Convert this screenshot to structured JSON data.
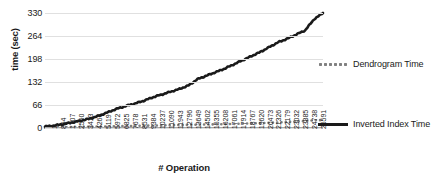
{
  "chart_data": {
    "type": "line",
    "title": "",
    "xlabel": "# Operation",
    "ylabel": "time (sec)",
    "ylim": [
      0,
      330
    ],
    "yticks": [
      0,
      66,
      132,
      198,
      264,
      330
    ],
    "grid": true,
    "legend_position": "right",
    "x_tick_labels": [
      "1",
      "854",
      "1707",
      "2560",
      "3413",
      "4266",
      "5119",
      "5972",
      "6825",
      "7678",
      "8531",
      "9384",
      "10237",
      "11090",
      "11943",
      "12796",
      "13649",
      "14502",
      "15355",
      "16208",
      "17061",
      "17914",
      "18767",
      "19620",
      "20473",
      "21326",
      "22179",
      "23032",
      "23885",
      "24738",
      "25591"
    ],
    "x_range": [
      1,
      26444
    ],
    "series": [
      {
        "name": "Dendrogram Time",
        "style": "dotted",
        "color": "#808080",
        "x": [
          1,
          854,
          1707,
          2560,
          3413,
          4266,
          5119,
          5972,
          6825,
          7678,
          8531,
          9384,
          10237,
          11090,
          11943,
          12796,
          13649,
          14502,
          15355,
          16208,
          17061,
          17914,
          18767,
          19620,
          20473,
          21326,
          22179,
          23032,
          23885,
          24738,
          25591,
          26444
        ],
        "values": [
          1,
          1.5,
          2,
          2.5,
          3,
          3.5,
          4,
          4.5,
          5,
          5.5,
          6,
          6.5,
          7,
          7.5,
          8,
          8.5,
          9,
          9.5,
          10,
          10.5,
          11,
          11.5,
          12.5,
          13,
          14,
          15,
          16,
          17,
          18.5,
          20,
          22,
          23
        ]
      },
      {
        "name": "Inverted Index Time",
        "style": "solid",
        "color": "#1a1a1a",
        "x": [
          1,
          854,
          1707,
          2560,
          3413,
          4266,
          5119,
          5972,
          6825,
          7678,
          8531,
          9384,
          10237,
          11090,
          11943,
          12796,
          13649,
          14502,
          15355,
          16208,
          17061,
          17914,
          18767,
          19620,
          20473,
          21326,
          22179,
          23032,
          23885,
          24738,
          25591,
          26444
        ],
        "values": [
          4,
          7,
          11,
          16,
          21,
          27,
          35,
          45,
          55,
          63,
          70,
          78,
          88,
          96,
          104,
          112,
          122,
          140,
          150,
          160,
          170,
          182,
          194,
          206,
          218,
          232,
          246,
          256,
          268,
          280,
          312,
          330
        ]
      }
    ]
  },
  "legend": {
    "entries": [
      {
        "label": "Dendrogram Time"
      },
      {
        "label": "Inverted Index Time"
      }
    ]
  }
}
